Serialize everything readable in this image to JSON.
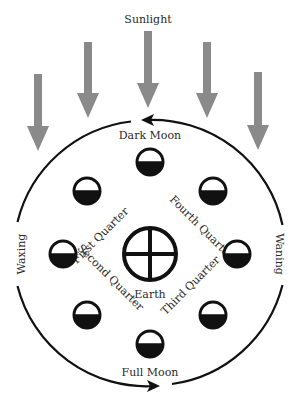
{
  "title": "Sunlight",
  "colors": {
    "arrow": "#8a8a8a",
    "line": "#111111",
    "background": "#ffffff"
  },
  "sunlight_arrows": [
    {
      "x": 38,
      "top": 74,
      "tip": 151
    },
    {
      "x": 88,
      "top": 42,
      "tip": 118
    },
    {
      "x": 148,
      "top": 31,
      "tip": 108
    },
    {
      "x": 207,
      "top": 42,
      "tip": 118
    },
    {
      "x": 258,
      "top": 72,
      "tip": 150
    }
  ],
  "orbit": {
    "cx": 150,
    "cy": 253,
    "r": 133
  },
  "earth": {
    "label": "Earth",
    "symbol": "circle-cross",
    "cx": 150,
    "cy": 255,
    "r": 26
  },
  "side_labels": {
    "left": "Waxing",
    "right": "Waning"
  },
  "phases": [
    {
      "name": "Dark Moon",
      "cx": 150,
      "cy": 162
    },
    {
      "name": "First Quarter",
      "cx": 87,
      "cy": 191
    },
    {
      "name": "",
      "cx": 63,
      "cy": 254
    },
    {
      "name": "Second Quarter",
      "cx": 87,
      "cy": 315
    },
    {
      "name": "Full Moon",
      "cx": 150,
      "cy": 344
    },
    {
      "name": "Third Quarter",
      "cx": 213,
      "cy": 315
    },
    {
      "name": "",
      "cx": 237,
      "cy": 254
    },
    {
      "name": "Fourth Quarter",
      "cx": 213,
      "cy": 191
    }
  ],
  "labels": {
    "sunlight": "Sunlight",
    "dark_moon": "Dark Moon",
    "full_moon": "Full Moon",
    "first_quarter": "First Quarter",
    "second_quarter": "Second Quarter",
    "third_quarter": "Third Quarter",
    "fourth_quarter": "Fourth Quarter",
    "earth": "Earth",
    "waxing": "Waxing",
    "waning": "Waning"
  }
}
